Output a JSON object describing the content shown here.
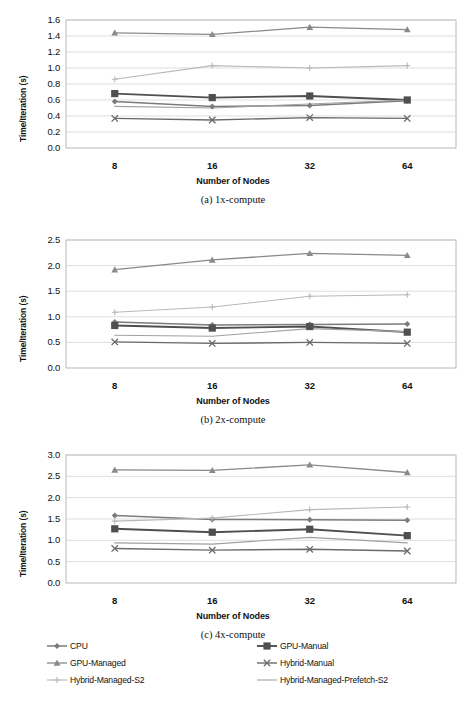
{
  "figure": {
    "axis_title_x": "Number of Nodes",
    "axis_title_y": "Time/Iteration (s)",
    "captions": [
      "(a) 1x-compute",
      "(b) 2x-compute",
      "(c) 4x-compute"
    ]
  },
  "legend": {
    "position": "bottom",
    "items": [
      {
        "label": "CPU",
        "marker": "diamond",
        "color": "#808080"
      },
      {
        "label": "GPU-Manual",
        "marker": "square",
        "color": "#595959"
      },
      {
        "label": "GPU-Managed",
        "marker": "triangle",
        "color": "#8c8c8c"
      },
      {
        "label": "Hybrid-Manual",
        "marker": "x",
        "color": "#6e6e6e"
      },
      {
        "label": "Hybrid-Managed-S2",
        "marker": "plus",
        "color": "#b5b5b5"
      },
      {
        "label": "Hybrid-Managed-Prefetch-S2",
        "marker": "line",
        "color": "#9a9a9a"
      }
    ]
  },
  "chart_data": [
    {
      "type": "line",
      "title": "(a) 1x-compute",
      "xlabel": "Number of Nodes",
      "ylabel": "Time/Iteration (s)",
      "categories": [
        "8",
        "16",
        "32",
        "64"
      ],
      "x": [
        8,
        16,
        32,
        64
      ],
      "ylim": [
        0.0,
        1.6
      ],
      "yticks": [
        "0.0",
        "0.2",
        "0.4",
        "0.6",
        "0.8",
        "1.0",
        "1.2",
        "1.4",
        "1.6"
      ],
      "grid": true,
      "series": [
        {
          "name": "CPU",
          "values": [
            0.58,
            0.52,
            0.53,
            0.59
          ]
        },
        {
          "name": "GPU-Manual",
          "values": [
            0.68,
            0.63,
            0.65,
            0.6
          ]
        },
        {
          "name": "GPU-Managed",
          "values": [
            1.44,
            1.42,
            1.51,
            1.48
          ]
        },
        {
          "name": "Hybrid-Manual",
          "values": [
            0.37,
            0.35,
            0.38,
            0.37
          ]
        },
        {
          "name": "Hybrid-Managed-S2",
          "values": [
            0.86,
            1.03,
            1.0,
            1.03
          ]
        },
        {
          "name": "Hybrid-Managed-Prefetch-S2",
          "values": [
            0.52,
            0.5,
            0.55,
            0.6
          ]
        }
      ]
    },
    {
      "type": "line",
      "title": "(b) 2x-compute",
      "xlabel": "Number of Nodes",
      "ylabel": "Time/Iteration (s)",
      "categories": [
        "8",
        "16",
        "32",
        "64"
      ],
      "x": [
        8,
        16,
        32,
        64
      ],
      "ylim": [
        0.0,
        2.5
      ],
      "yticks": [
        "0.0",
        "0.5",
        "1.0",
        "1.5",
        "2.0",
        "2.5"
      ],
      "grid": true,
      "series": [
        {
          "name": "CPU",
          "values": [
            0.9,
            0.84,
            0.85,
            0.86
          ]
        },
        {
          "name": "GPU-Manual",
          "values": [
            0.83,
            0.78,
            0.81,
            0.7
          ]
        },
        {
          "name": "GPU-Managed",
          "values": [
            1.92,
            2.11,
            2.24,
            2.2
          ]
        },
        {
          "name": "Hybrid-Manual",
          "values": [
            0.51,
            0.48,
            0.5,
            0.48
          ]
        },
        {
          "name": "Hybrid-Managed-S2",
          "values": [
            1.09,
            1.19,
            1.4,
            1.43
          ]
        },
        {
          "name": "Hybrid-Managed-Prefetch-S2",
          "values": [
            0.64,
            0.62,
            0.77,
            0.71
          ]
        }
      ]
    },
    {
      "type": "line",
      "title": "(c) 4x-compute",
      "xlabel": "Number of Nodes",
      "ylabel": "Time/Iteration (s)",
      "categories": [
        "8",
        "16",
        "32",
        "64"
      ],
      "x": [
        8,
        16,
        32,
        64
      ],
      "ylim": [
        0.0,
        3.0
      ],
      "yticks": [
        "0.0",
        "0.5",
        "1.0",
        "1.5",
        "2.0",
        "2.5",
        "3.0"
      ],
      "grid": true,
      "series": [
        {
          "name": "CPU",
          "values": [
            1.58,
            1.49,
            1.48,
            1.47
          ]
        },
        {
          "name": "GPU-Manual",
          "values": [
            1.27,
            1.19,
            1.26,
            1.11
          ]
        },
        {
          "name": "GPU-Managed",
          "values": [
            2.65,
            2.64,
            2.77,
            2.59
          ]
        },
        {
          "name": "Hybrid-Manual",
          "values": [
            0.81,
            0.77,
            0.79,
            0.75
          ]
        },
        {
          "name": "Hybrid-Managed-S2",
          "values": [
            1.45,
            1.52,
            1.72,
            1.78
          ]
        },
        {
          "name": "Hybrid-Managed-Prefetch-S2",
          "values": [
            0.94,
            0.91,
            1.07,
            0.94
          ]
        }
      ]
    }
  ]
}
